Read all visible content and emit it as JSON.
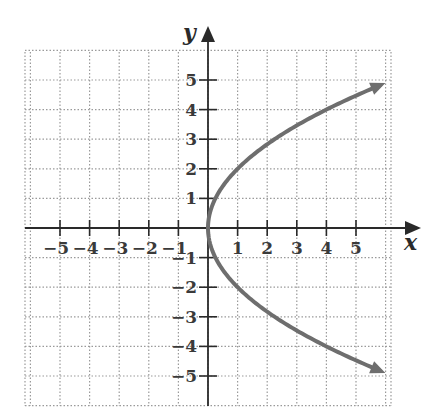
{
  "chart_data": {
    "type": "line",
    "title": "",
    "equation": "x = y^2 / 4",
    "xlabel": "x",
    "ylabel": "y",
    "xlim": [
      -6.2,
      6.2
    ],
    "ylim": [
      -6,
      6
    ],
    "grid": true,
    "grid_style": "dotted",
    "x_ticks": [
      -5,
      -4,
      -3,
      -2,
      -1,
      1,
      2,
      3,
      4,
      5
    ],
    "y_ticks": [
      -5,
      -4,
      -3,
      -2,
      -1,
      1,
      2,
      3,
      4,
      5
    ],
    "x_tick_labels": [
      "−5",
      "−4",
      "−3",
      "−2",
      "−1",
      "1",
      "2",
      "3",
      "4",
      "5"
    ],
    "y_tick_labels": [
      "−5",
      "−4",
      "−3",
      "−2",
      "−1",
      "1",
      "2",
      "3",
      "4",
      "5"
    ],
    "series": [
      {
        "name": "parabola opening right",
        "color": "#6e6e6e",
        "arrows": "both ends",
        "points": [
          {
            "x": 5.9,
            "y": 4.85
          },
          {
            "x": 4,
            "y": 4
          },
          {
            "x": 2.25,
            "y": 3
          },
          {
            "x": 1,
            "y": 2
          },
          {
            "x": 0.25,
            "y": 1
          },
          {
            "x": 0,
            "y": 0
          },
          {
            "x": 0.25,
            "y": -1
          },
          {
            "x": 1,
            "y": -2
          },
          {
            "x": 2.25,
            "y": -3
          },
          {
            "x": 4,
            "y": -4
          },
          {
            "x": 5.9,
            "y": -4.85
          }
        ]
      }
    ],
    "legend": null
  },
  "labels": {
    "x_axis": "x",
    "y_axis": "y"
  },
  "colors": {
    "axis": "#2a2a2a",
    "grid": "#9a9a9a",
    "curve": "#6e6e6e"
  }
}
